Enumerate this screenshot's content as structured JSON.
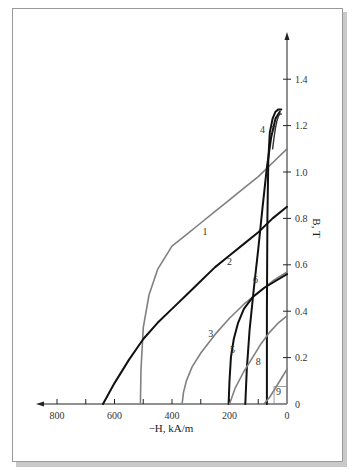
{
  "chart_data": {
    "type": "line",
    "title": "",
    "xlabel": "−H, kA/m",
    "ylabel": "B, T",
    "xlim": [
      0,
      850
    ],
    "ylim": [
      0,
      1.5
    ],
    "x_reversed": true,
    "grid": false,
    "legend": "none (curves numbered 1–9 inline)",
    "x_ticks": [
      0,
      100,
      200,
      300,
      400,
      500,
      600,
      700,
      800
    ],
    "x_tick_labels": [
      "0",
      "200",
      "400",
      "600",
      "800"
    ],
    "y_ticks": [
      0,
      0.2,
      0.4,
      0.6,
      0.8,
      1.0,
      1.2,
      1.4
    ],
    "y_tick_labels": [
      "0",
      "0.2",
      "0.4",
      "0.6",
      "0.8",
      "1.0",
      "1.2",
      "1.4"
    ],
    "series": [
      {
        "name": "1",
        "color": "#808080",
        "width": 1.6,
        "x": [
          510,
          508,
          500,
          480,
          450,
          400,
          350,
          300,
          250,
          200,
          150,
          100,
          50,
          0
        ],
        "y": [
          0,
          0.15,
          0.33,
          0.47,
          0.58,
          0.68,
          0.73,
          0.78,
          0.83,
          0.88,
          0.93,
          0.98,
          1.04,
          1.1
        ]
      },
      {
        "name": "2",
        "color": "#111111",
        "width": 2.0,
        "x": [
          640,
          600,
          550,
          500,
          450,
          400,
          350,
          300,
          250,
          200,
          150,
          100,
          50,
          0
        ],
        "y": [
          0,
          0.09,
          0.19,
          0.28,
          0.35,
          0.41,
          0.47,
          0.53,
          0.59,
          0.64,
          0.69,
          0.74,
          0.8,
          0.85
        ]
      },
      {
        "name": "3",
        "color": "#808080",
        "width": 1.6,
        "x": [
          365,
          360,
          350,
          330,
          300,
          250,
          200,
          150,
          100,
          50,
          0
        ],
        "y": [
          0,
          0.05,
          0.1,
          0.16,
          0.22,
          0.3,
          0.37,
          0.43,
          0.48,
          0.53,
          0.57
        ]
      },
      {
        "name": "4",
        "color": "#111111",
        "width": 2.0,
        "x": [
          70,
          70,
          68,
          65,
          60,
          50,
          40,
          30,
          20
        ],
        "y": [
          0,
          0.4,
          0.8,
          1.05,
          1.17,
          1.23,
          1.26,
          1.27,
          1.27
        ]
      },
      {
        "name": "5",
        "color": "#111111",
        "width": 2.0,
        "x": [
          203,
          200,
          195,
          185,
          170,
          150,
          120,
          80,
          40,
          0
        ],
        "y": [
          0,
          0.1,
          0.2,
          0.28,
          0.35,
          0.41,
          0.46,
          0.5,
          0.53,
          0.56
        ]
      },
      {
        "name": "6",
        "color": "#111111",
        "width": 2.0,
        "x": [
          145,
          140,
          130,
          115,
          100,
          85,
          70,
          55,
          40,
          25
        ],
        "y": [
          0,
          0.15,
          0.32,
          0.5,
          0.67,
          0.85,
          1.02,
          1.15,
          1.23,
          1.26
        ]
      },
      {
        "name": "7",
        "color": "#333333",
        "width": 1.4,
        "x": [
          50,
          45,
          40,
          35,
          30,
          25,
          20
        ],
        "y": [
          1.1,
          1.15,
          1.19,
          1.22,
          1.24,
          1.25,
          1.25
        ]
      },
      {
        "name": "8",
        "color": "#808080",
        "width": 1.6,
        "x": [
          200,
          180,
          150,
          120,
          90,
          60,
          30,
          0
        ],
        "y": [
          0,
          0.07,
          0.14,
          0.2,
          0.26,
          0.31,
          0.35,
          0.38
        ]
      },
      {
        "name": "9",
        "color": "#808080",
        "width": 1.6,
        "x": [
          80,
          60,
          40,
          20,
          0
        ],
        "y": [
          0,
          0.03,
          0.07,
          0.11,
          0.15
        ]
      }
    ],
    "curve_label_positions": [
      {
        "name": "1",
        "x": 285,
        "y": 0.73
      },
      {
        "name": "2",
        "x": 200,
        "y": 0.6
      },
      {
        "name": "3",
        "x": 265,
        "y": 0.29
      },
      {
        "name": "4",
        "x": 85,
        "y": 1.17
      },
      {
        "name": "5",
        "x": 190,
        "y": 0.22
      },
      {
        "name": "6",
        "x": 110,
        "y": 0.52
      },
      {
        "name": "7",
        "x": 48,
        "y": 1.17
      },
      {
        "name": "8",
        "x": 100,
        "y": 0.17
      },
      {
        "name": "9",
        "x": 30,
        "y": 0.04
      }
    ]
  }
}
